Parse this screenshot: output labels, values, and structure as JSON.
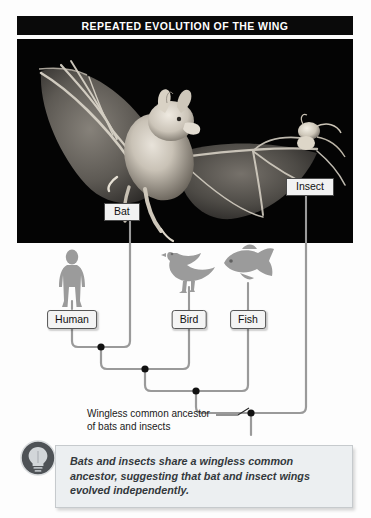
{
  "figure": {
    "title": "REPEATED EVOLUTION OF THE WING",
    "domain_label": "biology-cladogram-figure"
  },
  "photo": {
    "alt_name": "bat-in-flight-catching-insect-photograph",
    "background_color": "#030303",
    "callouts": [
      {
        "id": "bat",
        "label": "Bat",
        "x": 130,
        "y": 210
      },
      {
        "id": "insect",
        "label": "Insect",
        "x": 306,
        "y": 185
      }
    ]
  },
  "tree": {
    "taxa": [
      {
        "id": "human",
        "label": "Human",
        "x": 72,
        "silhouette": "human-silhouette"
      },
      {
        "id": "bat",
        "label": "Bat",
        "x": 130,
        "silhouette": "bat-photo-callout"
      },
      {
        "id": "bird",
        "label": "Bird",
        "x": 189,
        "silhouette": "bird-silhouette"
      },
      {
        "id": "fish",
        "label": "Fish",
        "x": 248,
        "silhouette": "fish-silhouette"
      },
      {
        "id": "insect",
        "label": "Insect",
        "x": 306,
        "silhouette": "insect-photo-callout"
      }
    ],
    "nodes": [
      {
        "id": "human-bat-node",
        "x": 101,
        "y": 104,
        "children": [
          "human",
          "bat"
        ]
      },
      {
        "id": "mammal-bird-node",
        "x": 145,
        "y": 126,
        "children": [
          "human-bat-node",
          "bird"
        ]
      },
      {
        "id": "vertebrate-node",
        "x": 196,
        "y": 148,
        "children": [
          "mammal-bird-node",
          "fish"
        ]
      },
      {
        "id": "wingless-common-ancestor-node",
        "x": 251,
        "y": 170,
        "children": [
          "vertebrate-node",
          "insect"
        ]
      }
    ],
    "annotation": {
      "id": "wingless-common-ancestor",
      "text": "Wingless common ancestor\nof bats and insects",
      "points_to": "wingless-common-ancestor-node"
    },
    "line_color": "#9a9a9a",
    "node_color": "#111111"
  },
  "caption": {
    "icon": "lightbulb-icon",
    "text": "Bats and insects share a wingless common ancestor, suggesting that bat and insect wings evolved independently.",
    "background_color": "#eceff1",
    "text_color": "#33383c"
  }
}
